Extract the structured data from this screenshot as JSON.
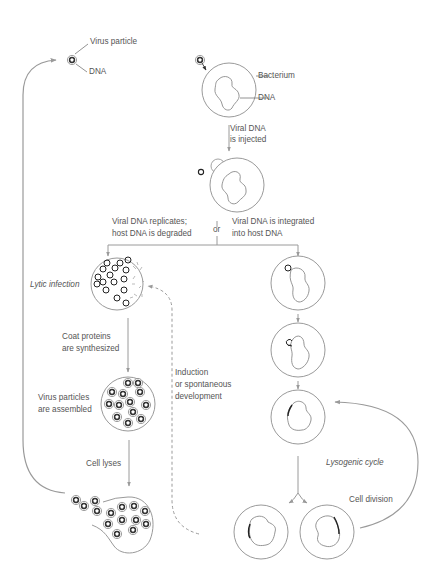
{
  "diagram": {
    "colors": {
      "line": "#9a9a9a",
      "text": "#555555",
      "dna": "#222222",
      "background": "#ffffff"
    },
    "labels": {
      "virus_particle": "Virus particle",
      "virus_dna": "DNA",
      "bacterium": "Bacterium",
      "bacterium_dna": "DNA",
      "injected_1": "Viral DNA",
      "injected_2": "is injected",
      "or": "or",
      "replicates_1": "Viral DNA replicates;",
      "replicates_2": "host DNA is degraded",
      "integrated_1": "Viral DNA is integrated",
      "integrated_2": "into host DNA",
      "lytic_infection": "Lytic infection",
      "coat_1": "Coat proteins",
      "coat_2": "are synthesized",
      "assembled_1": "Virus particles",
      "assembled_2": "are assembled",
      "induction_1": "Induction",
      "induction_2": "or spontaneous",
      "induction_3": "development",
      "cell_lyses": "Cell lyses",
      "lysogenic_cycle": "Lysogenic cycle",
      "cell_division": "Cell division"
    },
    "nodes": [
      {
        "id": "virus-particle",
        "icon": "virus-particle-icon"
      },
      {
        "id": "bacterium-attached",
        "icon": "bacterium-icon"
      },
      {
        "id": "dna-injected",
        "icon": "bacterium-icon"
      },
      {
        "id": "lytic-cell",
        "icon": "bacterium-icon"
      },
      {
        "id": "assembly-cell",
        "icon": "bacterium-icon"
      },
      {
        "id": "lysed-cell",
        "icon": "burst-cell-icon"
      },
      {
        "id": "prophage-1",
        "icon": "bacterium-icon"
      },
      {
        "id": "prophage-2",
        "icon": "bacterium-icon"
      },
      {
        "id": "prophage-3",
        "icon": "bacterium-icon"
      },
      {
        "id": "daughter-left",
        "icon": "bacterium-icon"
      },
      {
        "id": "daughter-right",
        "icon": "bacterium-icon"
      }
    ]
  }
}
